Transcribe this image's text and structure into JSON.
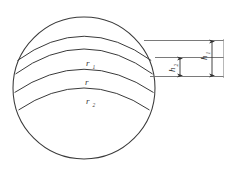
{
  "figure": {
    "title_note": "",
    "type": "sphere-zones-diagram",
    "background_color": "#ffffff",
    "stroke_color": "#3a3a3a",
    "labels": {
      "r1_base": "r",
      "r1_sub": "1",
      "r_base": "r",
      "r2_base": "r",
      "r2_sub": "2",
      "h1_base": "h",
      "h1_sub": "1",
      "h2_base": "h",
      "h2_sub": "2"
    },
    "geometry": {
      "sphere_center_x": 84,
      "sphere_center_y": 88,
      "sphere_radius": 71,
      "zone_top_y": 40,
      "zone_mid_y": 57,
      "zone_bottom_y": 76,
      "leader_right_x": 224,
      "h1_arrow_x": 212,
      "h2_arrow_x": 180
    }
  }
}
